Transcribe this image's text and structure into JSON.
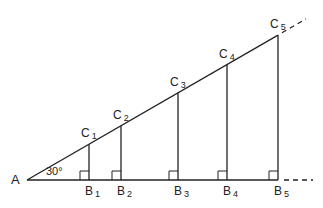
{
  "diagram": {
    "vertex": {
      "label": "A",
      "x": 27,
      "y": 180
    },
    "angle": {
      "label": "30°",
      "degrees": 30
    },
    "base_points": [
      {
        "label": "B",
        "sub": "1",
        "x": 89
      },
      {
        "label": "B",
        "sub": "2",
        "x": 121
      },
      {
        "label": "B",
        "sub": "3",
        "x": 178
      },
      {
        "label": "B",
        "sub": "4",
        "x": 227
      },
      {
        "label": "B",
        "sub": "5",
        "x": 278
      }
    ],
    "top_points": [
      {
        "label": "C",
        "sub": "1"
      },
      {
        "label": "C",
        "sub": "2"
      },
      {
        "label": "C",
        "sub": "3"
      },
      {
        "label": "C",
        "sub": "4"
      },
      {
        "label": "C",
        "sub": "5"
      }
    ],
    "line_color": "#222222"
  }
}
